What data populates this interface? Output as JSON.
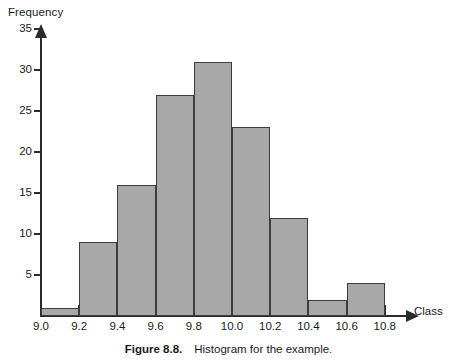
{
  "figure": {
    "caption_number": "Figure 8.8.",
    "caption_text": "Histogram for the example."
  },
  "chart_data": {
    "type": "bar",
    "title": "",
    "xlabel": "Class",
    "ylabel": "Frequency",
    "categories": [
      "9.0-9.2",
      "9.2-9.4",
      "9.4-9.6",
      "9.6-9.8",
      "9.8-10.0",
      "10.0-10.2",
      "10.2-10.4",
      "10.4-10.6",
      "10.6-10.8"
    ],
    "bin_edges": [
      9.0,
      9.2,
      9.4,
      9.6,
      9.8,
      10.0,
      10.2,
      10.4,
      10.6,
      10.8
    ],
    "values": [
      1,
      9,
      16,
      27,
      31,
      23,
      12,
      2,
      4
    ],
    "x_tick_labels": [
      "9.0",
      "9.2",
      "9.4",
      "9.6",
      "9.8",
      "10.0",
      "10.2",
      "10.4",
      "10.6",
      "10.8"
    ],
    "y_tick_labels": [
      "5",
      "10",
      "15",
      "20",
      "25",
      "30",
      "35"
    ],
    "y_tick_values": [
      5,
      10,
      15,
      20,
      25,
      30,
      35
    ],
    "ylim": [
      0,
      36
    ],
    "xlim": [
      9.0,
      10.8
    ],
    "grid": false,
    "legend": false,
    "bar_fill_color": "#a8a8a8",
    "bar_edge_color": "#3d3d3d",
    "axis_color": "#2b2b2b"
  }
}
